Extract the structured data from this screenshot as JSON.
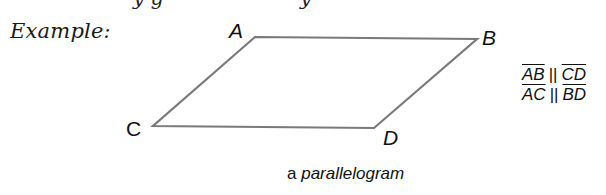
{
  "example_label": "Example:",
  "figure": {
    "shape": "parallelogram",
    "stroke_color": "#7a7a7a",
    "vertices": {
      "A": {
        "label": "A",
        "x": 255,
        "y": 37
      },
      "B": {
        "label": "B",
        "x": 477,
        "y": 39
      },
      "C": {
        "label": "C",
        "x": 153,
        "y": 126
      },
      "D": {
        "label": "D",
        "x": 374,
        "y": 128
      }
    }
  },
  "relations": [
    {
      "left": "AB",
      "symbol": "||",
      "right": "CD"
    },
    {
      "left": "AC",
      "symbol": "||",
      "right": "BD"
    }
  ],
  "caption": {
    "article": "a",
    "term": "parallelogram"
  }
}
